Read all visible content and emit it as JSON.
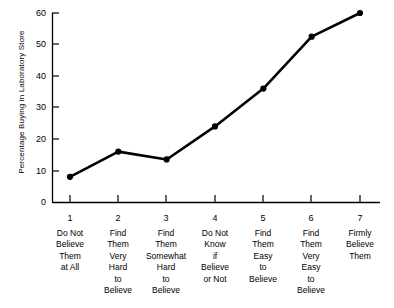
{
  "chart_data": {
    "type": "line",
    "title": "",
    "xlabel": "",
    "ylabel": "Percentage Buying in Laboratory Store",
    "ylim": [
      0,
      60
    ],
    "yticks": [
      0,
      10,
      20,
      30,
      40,
      50,
      60
    ],
    "grid": false,
    "legend": "none",
    "x": [
      1,
      2,
      3,
      4,
      5,
      6,
      7
    ],
    "categories": [
      "Do Not Believe Them at All",
      "Find Them Very Hard to Believe",
      "Find Them Somewhat Hard to Believe",
      "Do Not Know if Believe or Not",
      "Find Them Easy to Believe",
      "Find Them Very Easy to Believe",
      "Firmly Believe Them"
    ],
    "category_lines": [
      [
        "Do Not",
        "Believe",
        "Them",
        "at All"
      ],
      [
        "Find",
        "Them",
        "Very",
        "Hard",
        "to",
        "Believe"
      ],
      [
        "Find",
        "Them",
        "Somewhat",
        "Hard",
        "to",
        "Believe"
      ],
      [
        "Do Not",
        "Know",
        "if",
        "Believe",
        "or Not"
      ],
      [
        "Find",
        "Them",
        "Easy",
        "to",
        "Believe"
      ],
      [
        "Find",
        "Them",
        "Very",
        "Easy",
        "to",
        "Believe"
      ],
      [
        "Firmly",
        "Believe",
        "Them"
      ]
    ],
    "values": [
      8,
      16,
      13.5,
      24,
      36,
      52.5,
      60
    ],
    "series": [
      {
        "name": "Percentage Buying in Laboratory Store",
        "values": [
          8,
          16,
          13.5,
          24,
          36,
          52.5,
          60
        ]
      }
    ],
    "marker": "filled-circle",
    "line_color": "#000000",
    "marker_color": "#000000",
    "background_color": "#ffffff",
    "axis_color": "#000000"
  },
  "axis": {
    "y_tick_labels": [
      "60",
      "50",
      "40",
      "30",
      "20",
      "10",
      "0"
    ],
    "x_tick_numbers": [
      "1",
      "2",
      "3",
      "4",
      "5",
      "6",
      "7"
    ]
  }
}
